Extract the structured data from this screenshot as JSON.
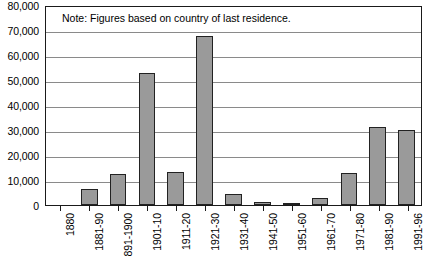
{
  "chart_data": {
    "type": "bar",
    "title": "",
    "subtitle": "",
    "annotation": "Note: Figures based on country of last residence.",
    "xlabel": "",
    "ylabel": "",
    "ylim": [
      0,
      80000
    ],
    "grid": true,
    "legend": "none",
    "y_ticks": [
      "80,000",
      "70,000",
      "60,000",
      "50,000",
      "40,000",
      "30,000",
      "20,000",
      "10,000",
      "0"
    ],
    "y_tick_values": [
      80000,
      70000,
      60000,
      50000,
      40000,
      30000,
      20000,
      10000,
      0
    ],
    "categories": [
      "1880",
      "1881-90",
      "891-1900",
      "1901-10",
      "1911-20",
      "1921-30",
      "1931-40",
      "1941-50",
      "1951-60",
      "1961-70",
      "1971-80",
      "1981-90",
      "1991-96"
    ],
    "values": [
      0,
      6300,
      12600,
      53000,
      13400,
      67500,
      4400,
      1200,
      1000,
      2900,
      12700,
      31200,
      30000
    ]
  }
}
